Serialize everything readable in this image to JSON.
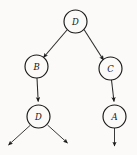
{
  "diagram": {
    "type": "tree",
    "background_color": "#fbfaf8",
    "stroke_color": "#1a1a1a",
    "label_color": "#151515",
    "node_radius": 11.5,
    "nodes": [
      {
        "id": "root",
        "label": "D",
        "cx": 75.5,
        "cy": 21.5
      },
      {
        "id": "left",
        "label": "B",
        "cx": 36.5,
        "cy": 66.5
      },
      {
        "id": "right",
        "label": "C",
        "cx": 110.5,
        "cy": 68.5
      },
      {
        "id": "leftchild",
        "label": "D",
        "cx": 38.5,
        "cy": 116.5
      },
      {
        "id": "rightchild",
        "label": "A",
        "cx": 114.5,
        "cy": 116.5
      }
    ],
    "edges": [
      {
        "id": "root-to-left",
        "from": "root",
        "to": "left",
        "arrow": true
      },
      {
        "id": "root-to-right",
        "from": "root",
        "to": "right",
        "arrow": true
      },
      {
        "id": "left-to-leftchild",
        "from": "left",
        "to": "leftchild",
        "arrow": true
      },
      {
        "id": "right-to-rightchild",
        "from": "right",
        "to": "rightchild",
        "arrow": true
      },
      {
        "id": "leftchild-out-left",
        "from": "leftchild",
        "to": "open",
        "arrow": true
      },
      {
        "id": "leftchild-out-right",
        "from": "leftchild",
        "to": "open",
        "arrow": true
      },
      {
        "id": "rightchild-out-down",
        "from": "rightchild",
        "to": "open",
        "arrow": true
      }
    ]
  }
}
